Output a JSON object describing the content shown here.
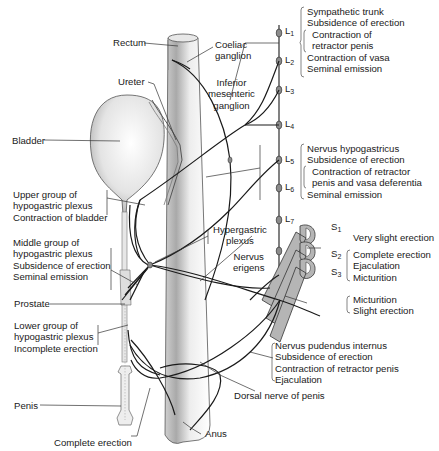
{
  "figure": {
    "colors": {
      "line": "#1a1a1a",
      "stipple": "#9a9a9a",
      "ganglion": "#8c8c8c",
      "grey_matter": "#b5b5b5",
      "background": "#ffffff"
    }
  },
  "labels": {
    "rectum": "Rectum",
    "coeliac": [
      "Coeliac",
      "ganglion"
    ],
    "ureter": "Ureter",
    "inferior_mesenteric": [
      "Inferior",
      "mesenteric",
      "ganglion"
    ],
    "bladder": "Bladder",
    "upper_group": [
      "Upper group of",
      "hypogastric plexus",
      "Contraction of bladder"
    ],
    "middle_group": [
      "Middle group of",
      "hypogastric plexus",
      "Subsidence of erection",
      "Seminal emission"
    ],
    "hypergastric": [
      "Hypergastric",
      "plexus"
    ],
    "nervus_erigens": [
      "Nervus",
      "erigens"
    ],
    "prostate": "Prostate",
    "lower_group": [
      "Lower group of",
      "hypogastric plexus",
      "Incomplete erection"
    ],
    "penis": "Penis",
    "complete_erection": "Complete erection",
    "anus": "Anus",
    "dorsal_nerve": "Dorsal nerve of penis",
    "sympathetic_trunk": [
      "Sympathetic trunk",
      "Subsidence of erection",
      "Contraction of",
      "retractor penis",
      "Contraction of vasa",
      "Seminal emission"
    ],
    "nervus_hypogastricus": [
      "Nervus hypogastricus",
      "Subsidence of erection",
      "Contraction of retractor",
      "penis and vasa deferentia",
      "Seminal emission"
    ],
    "s1_effect": "Very slight erection",
    "s2_s3_effect": [
      "Complete erection",
      "Ejaculation",
      "Micturition"
    ],
    "s3_lower_effect": [
      "Micturition",
      "Slight erection"
    ],
    "nervus_pudendus": [
      "Nervus pudendus internus",
      "Subsidence of erection",
      "Contraction of retractor penis",
      "Ejaculation"
    ]
  },
  "segments": {
    "lumbar": [
      {
        "letter": "L",
        "num": "1"
      },
      {
        "letter": "L",
        "num": "2"
      },
      {
        "letter": "L",
        "num": "3"
      },
      {
        "letter": "L",
        "num": "4"
      },
      {
        "letter": "L",
        "num": "5"
      },
      {
        "letter": "L",
        "num": "6"
      },
      {
        "letter": "L",
        "num": "7"
      }
    ],
    "sacral": [
      {
        "letter": "S",
        "num": "1"
      },
      {
        "letter": "S",
        "num": "2"
      },
      {
        "letter": "S",
        "num": "3"
      }
    ]
  }
}
